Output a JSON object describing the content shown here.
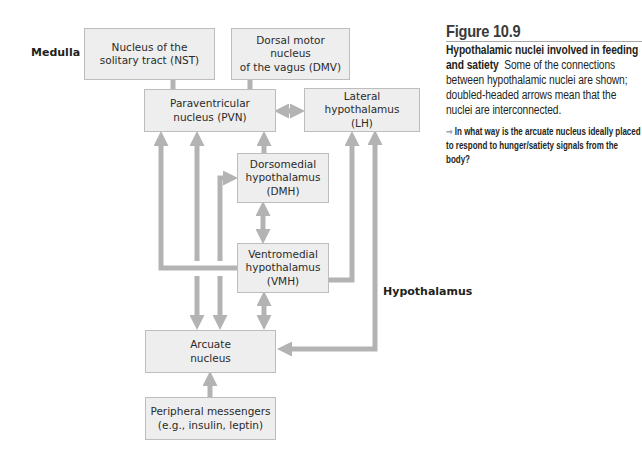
{
  "regions": {
    "medulla": "Medulla",
    "hypothalamus": "Hypothalamus"
  },
  "nodes": {
    "nst": {
      "line1": "Nucleus of the",
      "line2": "solitary tract (NST)"
    },
    "dmv": {
      "line1": "Dorsal motor nucleus",
      "line2": "of the vagus (DMV)"
    },
    "pvn": {
      "line1": "Paraventricular",
      "line2": "nucleus (PVN)"
    },
    "lh": {
      "line1": "Lateral hypothalamus",
      "line2": "(LH)"
    },
    "dmh": {
      "line1": "Dorsomedial",
      "line2": "hypothalamus",
      "line3": "(DMH)"
    },
    "vmh": {
      "line1": "Ventromedial",
      "line2": "hypothalamus",
      "line3": "(VMH)"
    },
    "arcuate": {
      "line1": "Arcuate",
      "line2": "nucleus"
    },
    "peripheral": {
      "line1": "Peripheral messengers",
      "line2": "(e.g., insulin, leptin)"
    }
  },
  "edges": [
    {
      "from": "PVN",
      "to": "NST",
      "type": "single"
    },
    {
      "from": "PVN",
      "to": "DMV",
      "type": "single"
    },
    {
      "from": "PVN",
      "to": "LH",
      "type": "double"
    },
    {
      "from": "DMH",
      "to": "PVN",
      "type": "single"
    },
    {
      "from": "VMH",
      "to": "PVN",
      "type": "single"
    },
    {
      "from": "Arcuate",
      "to": "PVN",
      "type": "single"
    },
    {
      "from": "Arcuate",
      "to": "DMH",
      "type": "single"
    },
    {
      "from": "DMH",
      "to": "VMH",
      "type": "double"
    },
    {
      "from": "VMH",
      "to": "LH",
      "type": "single"
    },
    {
      "from": "Arcuate",
      "to": "LH",
      "type": "double"
    },
    {
      "from": "VMH",
      "to": "Arcuate",
      "type": "double"
    },
    {
      "from": "PVN",
      "to": "Arcuate",
      "type": "single"
    },
    {
      "from": "DMH",
      "to": "Arcuate",
      "type": "single"
    },
    {
      "from": "Peripheral messengers",
      "to": "Arcuate",
      "type": "single"
    }
  ],
  "colors": {
    "box_fill": "#eeeeee",
    "box_border": "#bdbdbd",
    "arrow": "#b3b3b3",
    "question_arrow": "#9aa7b5"
  },
  "caption": {
    "figure_number": "Figure 10.9",
    "title": "Hypothalamic nuclei involved in feeding and satiety",
    "body": "Some of the connections between hypothalamic nuclei are shown; doubled-headed arrows mean that the nuclei are interconnected.",
    "question_arrow": "➞",
    "question": "In what way is the arcuate nucleus ideally placed to respond to hunger/satiety signals from the body?"
  }
}
